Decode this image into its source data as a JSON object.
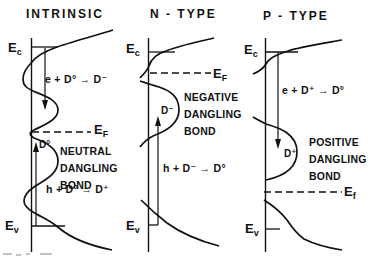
{
  "figure": {
    "background": "#ffffff",
    "ink": "#111111"
  },
  "panels": [
    {
      "id": "intrinsic",
      "title": "INTRINSIC",
      "band_labels": {
        "ec": {
          "base": "E",
          "sub": "c"
        },
        "ev": {
          "base": "E",
          "sub": "v"
        },
        "ef": {
          "base": "E",
          "sub": "F"
        }
      },
      "defect_label": "D°",
      "description": [
        "NEUTRAL",
        "DANGLING",
        "BOND"
      ],
      "reactions": {
        "upper": "e + D° → D⁻",
        "lower": "h + D° → D⁺"
      }
    },
    {
      "id": "n-type",
      "title": "N - TYPE",
      "band_labels": {
        "ec": {
          "base": "E",
          "sub": "c"
        },
        "ev": {
          "base": "E",
          "sub": "v"
        },
        "ef": {
          "base": "E",
          "sub": "F"
        }
      },
      "defect_label": "D⁻",
      "description": [
        "NEGATIVE",
        "DANGLING",
        "BOND"
      ],
      "reactions": {
        "lower": "h + D⁻ → D°"
      }
    },
    {
      "id": "p-type",
      "title": "P - TYPE",
      "band_labels": {
        "ec": {
          "base": "E",
          "sub": "c"
        },
        "ev": {
          "base": "E",
          "sub": "v"
        },
        "ef": {
          "base": "E",
          "sub": "f"
        }
      },
      "defect_label": "D⁺",
      "description": [
        "POSITIVE",
        "DANGLING",
        "BOND"
      ],
      "reactions": {
        "upper": "e + D⁺ → D°"
      }
    }
  ]
}
